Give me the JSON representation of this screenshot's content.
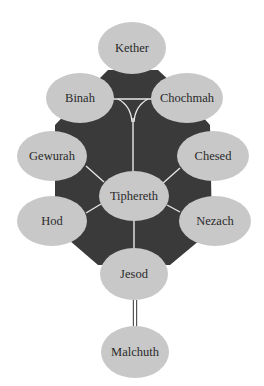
{
  "diagram": {
    "title": "",
    "colors": {
      "background": "#ffffff",
      "octagon_fill": "#3a3a3a",
      "node_fill": "#c8c8c8",
      "connector": "#e8e8e8",
      "text": "#2a2a2a",
      "double_line": "#555555"
    },
    "nodes": [
      {
        "id": "kether",
        "label": "Kether",
        "cx": 132,
        "cy": 48,
        "rx": 34,
        "ry": 26
      },
      {
        "id": "binah",
        "label": "Binah",
        "cx": 80,
        "cy": 98,
        "rx": 34,
        "ry": 25
      },
      {
        "id": "chochmah",
        "label": "Chochmah",
        "cx": 187,
        "cy": 98,
        "rx": 36,
        "ry": 25
      },
      {
        "id": "gewurah",
        "label": "Gewurah",
        "cx": 52,
        "cy": 156,
        "rx": 35,
        "ry": 25
      },
      {
        "id": "chesed",
        "label": "Chesed",
        "cx": 213,
        "cy": 156,
        "rx": 36,
        "ry": 25
      },
      {
        "id": "tiphereth",
        "label": "Tiphereth",
        "cx": 134,
        "cy": 196,
        "rx": 35,
        "ry": 25
      },
      {
        "id": "hod",
        "label": "Hod",
        "cx": 52,
        "cy": 221,
        "rx": 35,
        "ry": 25
      },
      {
        "id": "nezach",
        "label": "Nezach",
        "cx": 215,
        "cy": 221,
        "rx": 36,
        "ry": 25
      },
      {
        "id": "jesod",
        "label": "Jesod",
        "cx": 134,
        "cy": 274,
        "rx": 34,
        "ry": 26
      },
      {
        "id": "malchuth",
        "label": "Malchuth",
        "cx": 135,
        "cy": 352,
        "rx": 34,
        "ry": 26
      }
    ],
    "octagon_points": "108,70 158,70 172,83 210,125 212,230 170,265 98,265 55,228 55,125 95,83",
    "connectors": [
      {
        "id": "binah-chochmah",
        "d": "M112,99 L152,99"
      },
      {
        "id": "binah-branch",
        "d": "M118,99 Q131,106 132,122"
      },
      {
        "id": "chochmah-branch",
        "d": "M148,99 Q135,106 134,122"
      },
      {
        "id": "center-stem",
        "d": "M133,118 L133,171"
      },
      {
        "id": "gewurah-tiphereth",
        "d": "M86,166 L104,182"
      },
      {
        "id": "chesed-tiphereth",
        "d": "M180,168 L162,184"
      },
      {
        "id": "hod-tiphereth",
        "d": "M86,213 L101,204"
      },
      {
        "id": "nezach-tiphereth",
        "d": "M180,212 L167,205"
      },
      {
        "id": "tiphereth-jesod",
        "d": "M134,221 L134,248"
      }
    ],
    "double_line": {
      "x": 135,
      "y1": 300,
      "y2": 326
    }
  }
}
